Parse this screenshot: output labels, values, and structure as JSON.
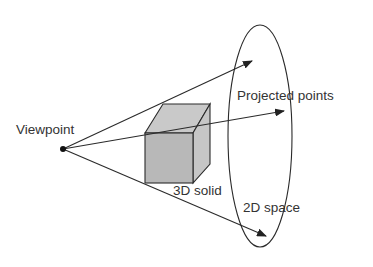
{
  "diagram": {
    "labels": {
      "viewpoint": "Viewpoint",
      "projected_points": "Projected points",
      "solid": "3D solid",
      "space": "2D space"
    },
    "colors": {
      "stroke": "#2a2a2a",
      "cube_fill": "#b8b8b8",
      "cube_side": "#c6c6c6",
      "cube_top": "#c9c9c9",
      "text": "#333333"
    }
  }
}
